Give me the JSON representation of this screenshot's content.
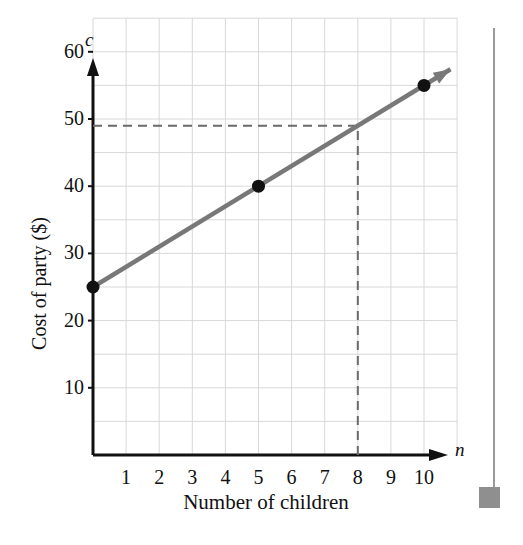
{
  "chart_data": {
    "type": "line",
    "title": "",
    "xlabel": "Number of children",
    "ylabel": "Cost of party ($)",
    "x_axis_variable": "n",
    "y_axis_variable": "c",
    "xlim": [
      0,
      11
    ],
    "ylim": [
      0,
      65
    ],
    "grid": true,
    "grid_x_step": 1,
    "grid_y_step": 5,
    "legend": "none",
    "x_tick_labels": [
      "1",
      "2",
      "3",
      "4",
      "5",
      "6",
      "7",
      "8",
      "9",
      "10"
    ],
    "x_tick_values": [
      1,
      2,
      3,
      4,
      5,
      6,
      7,
      8,
      9,
      10
    ],
    "y_tick_labels": [
      "10",
      "20",
      "30",
      "40",
      "50",
      "60"
    ],
    "y_tick_values": [
      10,
      20,
      30,
      40,
      50,
      60
    ],
    "series": [
      {
        "name": "Cost of party",
        "equation": "c = 25 + 3n",
        "line_color": "#787878",
        "x": [
          0,
          10.8
        ],
        "values": [
          25,
          57.4
        ],
        "arrow_end": true,
        "marker_color": "#111111",
        "markers": [
          {
            "x": 0,
            "y": 25
          },
          {
            "x": 5,
            "y": 40
          },
          {
            "x": 10,
            "y": 55
          }
        ]
      }
    ],
    "annotations": [
      {
        "name": "reference-dashed-horizontal",
        "style": "dashed",
        "color": "#6a6a6a",
        "from": {
          "x": 0,
          "y": 49
        },
        "to": {
          "x": 8,
          "y": 49
        }
      },
      {
        "name": "reference-dashed-vertical",
        "style": "dashed",
        "color": "#6a6a6a",
        "from": {
          "x": 8,
          "y": 0
        },
        "to": {
          "x": 8,
          "y": 49
        }
      }
    ],
    "colors": {
      "line": "#787878",
      "marker": "#111111",
      "axis": "#111111",
      "grid": "#d8d8d8",
      "dashed": "#6a6a6a",
      "page_rule": "#9a9a9a",
      "page_block": "#8f8f8f"
    }
  },
  "figure": {
    "x_axis_variable": "n",
    "y_axis_variable": "c",
    "x_axis_title": "Number of children",
    "y_axis_title": "Cost of party ($)"
  }
}
